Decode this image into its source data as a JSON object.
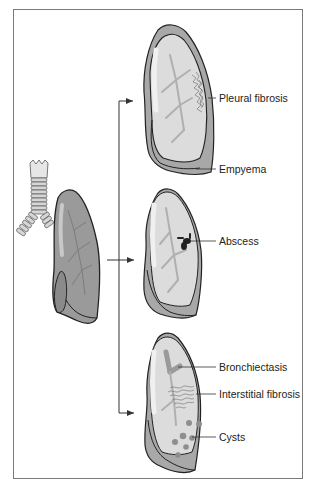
{
  "figure": {
    "source": {
      "name": "normal-lung-with-trachea"
    },
    "panels": [
      {
        "id": "top",
        "labels": [
          {
            "text": "Pleural fibrosis"
          },
          {
            "text": "Empyema"
          }
        ]
      },
      {
        "id": "middle",
        "labels": [
          {
            "text": "Abscess"
          }
        ]
      },
      {
        "id": "bottom",
        "labels": [
          {
            "text": "Bronchiectasis"
          },
          {
            "text": "Interstitial fibrosis"
          },
          {
            "text": "Cysts"
          }
        ]
      }
    ],
    "colors": {
      "lung_dark": "#8f8f8f",
      "lung_light": "#d9d9d9",
      "lung_highlight": "#efefef",
      "outline": "#222222",
      "pleura": "#a8a8a8",
      "bronchi": "#b3b3b3",
      "frame": "#7a7a7a"
    }
  }
}
